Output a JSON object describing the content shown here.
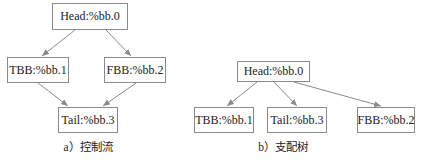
{
  "diagrams": [
    {
      "id": "control-flow",
      "caption": "a）控制流",
      "nodes": [
        {
          "id": "head",
          "label": "Head:%bb.0"
        },
        {
          "id": "tbb",
          "label": "TBB:%bb.1"
        },
        {
          "id": "fbb",
          "label": "FBB:%bb.2"
        },
        {
          "id": "tail",
          "label": "Tail:%bb.3"
        }
      ],
      "edges": [
        {
          "from": "head",
          "to": "tbb"
        },
        {
          "from": "head",
          "to": "fbb"
        },
        {
          "from": "tbb",
          "to": "tail"
        },
        {
          "from": "fbb",
          "to": "tail"
        }
      ]
    },
    {
      "id": "dominator-tree",
      "caption": "b）支配树",
      "nodes": [
        {
          "id": "head",
          "label": "Head:%bb.0"
        },
        {
          "id": "tbb",
          "label": "TBB:%bb.1"
        },
        {
          "id": "tail",
          "label": "Tail:%bb.3"
        },
        {
          "id": "fbb",
          "label": "FBB:%bb.2"
        }
      ],
      "edges": [
        {
          "from": "head",
          "to": "tbb"
        },
        {
          "from": "head",
          "to": "tail"
        },
        {
          "from": "head",
          "to": "fbb"
        }
      ]
    }
  ],
  "colors": {
    "edge": "#8a8a8a",
    "border": "#8a8a8a"
  }
}
